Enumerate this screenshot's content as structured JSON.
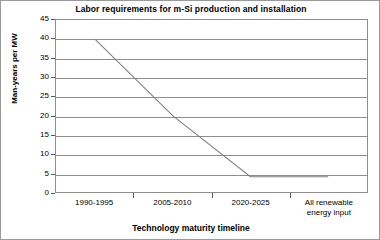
{
  "chart_data": {
    "type": "line",
    "title": "Labor requirements for m-Si production and installation",
    "xlabel": "Technology maturity timeline",
    "ylabel": "Man-years per MW",
    "categories": [
      "1990-1995",
      "2005-2010",
      "2020-2025",
      "All renewable energy input"
    ],
    "values": [
      40,
      20,
      4,
      4
    ],
    "yticks": [
      0,
      5,
      10,
      15,
      20,
      25,
      30,
      35,
      40,
      45
    ],
    "ylim": [
      0,
      45
    ],
    "grid": true,
    "legend": false,
    "series_color": "#808080"
  },
  "axis": {
    "y_tick_labels": [
      "45",
      "40",
      "35",
      "30",
      "25",
      "20",
      "15",
      "10",
      "5",
      "0"
    ],
    "x_tick_labels": [
      {
        "line1": "1990-1995",
        "line2": ""
      },
      {
        "line1": "2005-2010",
        "line2": ""
      },
      {
        "line1": "2020-2025",
        "line2": ""
      },
      {
        "line1": "All renewable",
        "line2": "energy input"
      }
    ]
  }
}
